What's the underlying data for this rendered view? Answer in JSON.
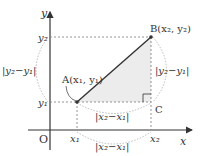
{
  "diagram": {
    "axes": {
      "x_label": "x",
      "y_label": "y",
      "origin_label": "O"
    },
    "points": {
      "A": {
        "name": "A",
        "coords": "(x₁, y₁)",
        "label": "A(x₁, y₁)"
      },
      "B": {
        "name": "B",
        "coords": "(x₂, y₂)",
        "label": "B(x₂, y₂)"
      },
      "C": {
        "name": "C",
        "label": "C"
      }
    },
    "ticks": {
      "x1": "x₁",
      "x2": "x₂",
      "y1": "y₁",
      "y2": "y₂"
    },
    "distances": {
      "horizontal_in_triangle": "|x₂−x₁|",
      "horizontal_below_axis": "|x₂−x₁|",
      "vertical_left": "|y₂−y₁|",
      "vertical_right": "|y₂−y₁|"
    },
    "colors": {
      "line": "#333333",
      "fill": "#ececec",
      "dotted": "#888888"
    }
  }
}
